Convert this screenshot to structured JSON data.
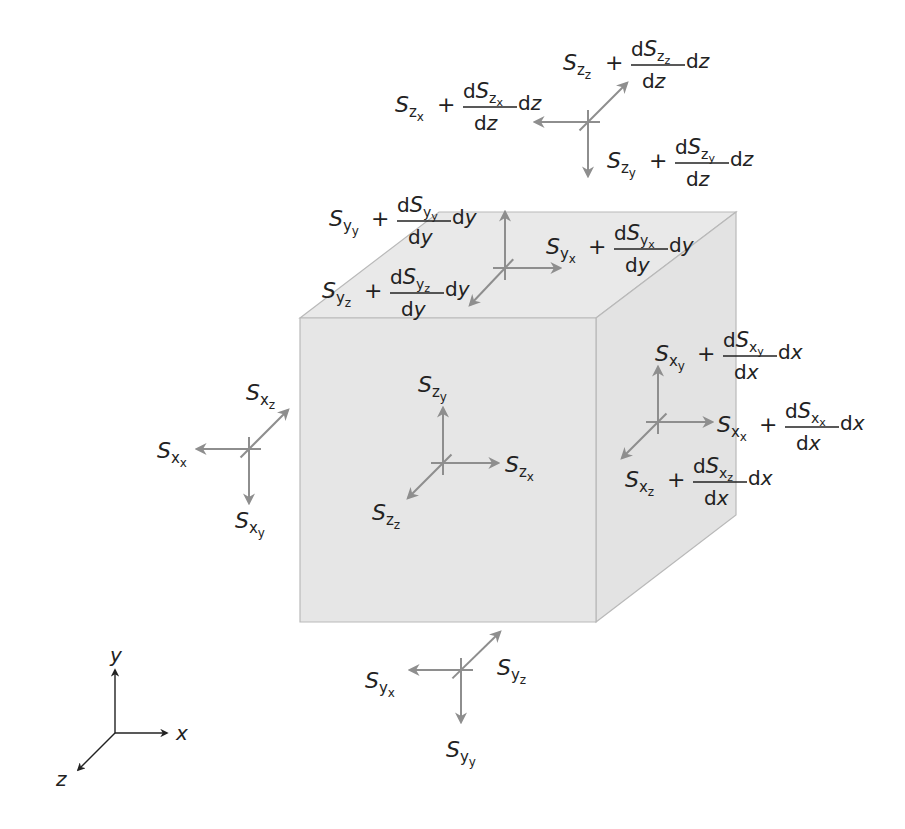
{
  "diagram": {
    "colors": {
      "cube_front": "#e6e6e6",
      "cube_top": "#e9e9e9",
      "cube_side": "#e3e3e3",
      "cube_edge": "#b9b9b9",
      "arrow": "#8e8e8e",
      "text": "#222222"
    },
    "cube": {
      "front": [
        [
          300,
          318
        ],
        [
          596,
          318
        ],
        [
          596,
          622
        ],
        [
          300,
          622
        ]
      ],
      "top": [
        [
          300,
          318
        ],
        [
          439,
          212
        ],
        [
          736,
          212
        ],
        [
          596,
          318
        ]
      ],
      "side": [
        [
          596,
          318
        ],
        [
          736,
          212
        ],
        [
          736,
          515
        ],
        [
          596,
          622
        ]
      ]
    },
    "arrow_groups": [
      {
        "name": "z-top-group",
        "center": [
          588,
          122
        ],
        "arrows": [
          [
            535,
            122
          ],
          [
            627,
            83
          ],
          [
            588,
            176
          ]
        ]
      },
      {
        "name": "y-top-face-group",
        "center": [
          505,
          268
        ],
        "arrows": [
          [
            505,
            212
          ],
          [
            560,
            268
          ],
          [
            470,
            305
          ]
        ]
      },
      {
        "name": "z-front-face-group",
        "center": [
          443,
          463
        ],
        "arrows": [
          [
            443,
            408
          ],
          [
            498,
            463
          ],
          [
            408,
            498
          ]
        ]
      },
      {
        "name": "x-right-face-group",
        "center": [
          658,
          422
        ],
        "arrows": [
          [
            658,
            367
          ],
          [
            712,
            422
          ],
          [
            622,
            458
          ]
        ]
      },
      {
        "name": "x-left-group",
        "center": [
          249,
          449
        ],
        "arrows": [
          [
            197,
            449
          ],
          [
            288,
            410
          ],
          [
            249,
            503
          ]
        ]
      },
      {
        "name": "y-bottom-group",
        "center": [
          461,
          670
        ],
        "arrows": [
          [
            410,
            670
          ],
          [
            500,
            632
          ],
          [
            461,
            722
          ]
        ]
      }
    ],
    "simple_labels": [
      {
        "name": "label-Szy-front",
        "x": 418,
        "y": 392,
        "base": "S",
        "sub": "z",
        "sub2": "y"
      },
      {
        "name": "label-Szx-front",
        "x": 505,
        "y": 472,
        "base": "S",
        "sub": "z",
        "sub2": "x"
      },
      {
        "name": "label-Szz-front",
        "x": 372,
        "y": 520,
        "base": "S",
        "sub": "z",
        "sub2": "z"
      },
      {
        "name": "label-Sxz-left",
        "x": 246,
        "y": 400,
        "base": "S",
        "sub": "x",
        "sub2": "z"
      },
      {
        "name": "label-Sxx-left",
        "x": 157,
        "y": 458,
        "base": "S",
        "sub": "x",
        "sub2": "x"
      },
      {
        "name": "label-Sxy-left",
        "x": 235,
        "y": 528,
        "base": "S",
        "sub": "x",
        "sub2": "y"
      },
      {
        "name": "label-Syz-bottom",
        "x": 497,
        "y": 675,
        "base": "S",
        "sub": "y",
        "sub2": "z"
      },
      {
        "name": "label-Syx-bottom",
        "x": 365,
        "y": 688,
        "base": "S",
        "sub": "y",
        "sub2": "x"
      },
      {
        "name": "label-Syy-bottom",
        "x": 446,
        "y": 757,
        "base": "S",
        "sub": "y",
        "sub2": "y"
      }
    ],
    "expr_labels": [
      {
        "name": "label-Szz-plus-dSzz",
        "x": 563,
        "y": 70,
        "sub": "z",
        "sub2": "z",
        "d": "z"
      },
      {
        "name": "label-Szx-plus-dSzx",
        "x": 395,
        "y": 112,
        "sub": "z",
        "sub2": "x",
        "d": "z"
      },
      {
        "name": "label-Szy-plus-dSzy",
        "x": 607,
        "y": 168,
        "sub": "z",
        "sub2": "y",
        "d": "z"
      },
      {
        "name": "label-Syy-plus-dSyy",
        "x": 329,
        "y": 226,
        "sub": "y",
        "sub2": "y",
        "d": "y"
      },
      {
        "name": "label-Syx-plus-dSyx",
        "x": 546,
        "y": 254,
        "sub": "y",
        "sub2": "x",
        "d": "y"
      },
      {
        "name": "label-Syz-plus-dSyz",
        "x": 322,
        "y": 298,
        "sub": "y",
        "sub2": "z",
        "d": "y"
      },
      {
        "name": "label-Sxy-plus-dSxy",
        "x": 655,
        "y": 361,
        "sub": "x",
        "sub2": "y",
        "d": "x"
      },
      {
        "name": "label-Sxx-plus-dSxx",
        "x": 717,
        "y": 432,
        "sub": "x",
        "sub2": "x",
        "d": "x"
      },
      {
        "name": "label-Sxz-plus-dSxz",
        "x": 625,
        "y": 487,
        "sub": "x",
        "sub2": "z",
        "d": "x"
      }
    ],
    "expr_parts": {
      "base": "S",
      "plus": "+",
      "diff": "d"
    },
    "axes": {
      "origin": [
        115,
        733
      ],
      "y_end": [
        115,
        670
      ],
      "x_end": [
        167,
        733
      ],
      "z_end": [
        78,
        770
      ],
      "labels": {
        "x": "x",
        "y": "y",
        "z": "z"
      },
      "label_pos": {
        "x": [
          176,
          740
        ],
        "y": [
          110,
          662
        ],
        "z": [
          56,
          786
        ]
      }
    }
  }
}
